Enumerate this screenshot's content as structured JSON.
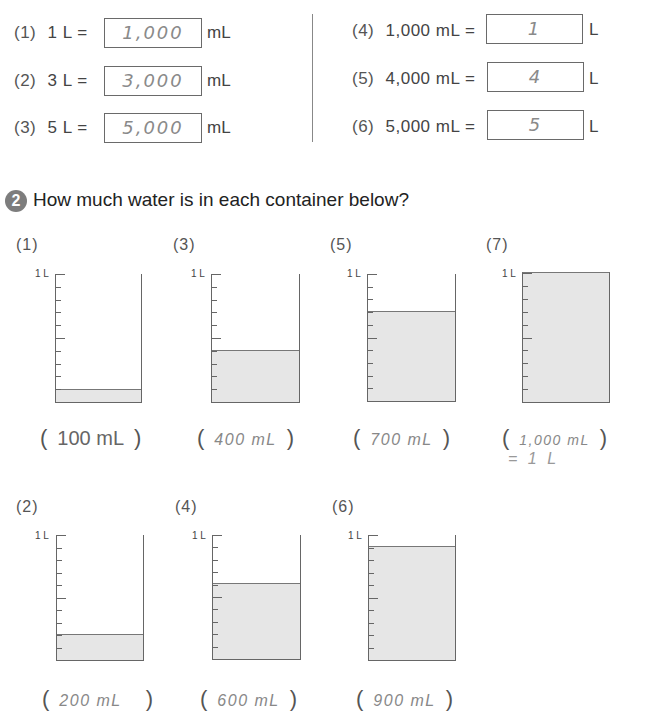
{
  "part1": {
    "left": [
      {
        "num": "(1)",
        "lhs": "1 L =",
        "answer": "1,000",
        "unit": "mL"
      },
      {
        "num": "(2)",
        "lhs": "3 L =",
        "answer": "3,000",
        "unit": "mL"
      },
      {
        "num": "(3)",
        "lhs": "5 L =",
        "answer": "5,000",
        "unit": "mL"
      }
    ],
    "right": [
      {
        "num": "(4)",
        "lhs": "1,000 mL =",
        "answer": "1",
        "unit": "L"
      },
      {
        "num": "(5)",
        "lhs": "4,000 mL =",
        "answer": "4",
        "unit": "L"
      },
      {
        "num": "(6)",
        "lhs": "5,000 mL =",
        "answer": "5",
        "unit": "L"
      }
    ]
  },
  "part2": {
    "badge": "2",
    "heading": "How much water is in each container below?",
    "scale_label": "1 L",
    "containers": [
      {
        "num": "(1)",
        "fill_ml": 100,
        "answer": "100 mL"
      },
      {
        "num": "(3)",
        "fill_ml": 400,
        "answer": "400 mL"
      },
      {
        "num": "(5)",
        "fill_ml": 700,
        "answer": "700 mL"
      },
      {
        "num": "(7)",
        "fill_ml": 1000,
        "answer": "1,000 mL",
        "note": "= 1 L"
      },
      {
        "num": "(2)",
        "fill_ml": 200,
        "answer": "200 mL"
      },
      {
        "num": "(4)",
        "fill_ml": 600,
        "answer": "600 mL"
      },
      {
        "num": "(6)",
        "fill_ml": 900,
        "answer": "900 mL"
      }
    ]
  }
}
